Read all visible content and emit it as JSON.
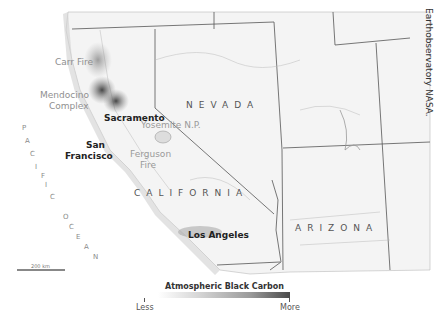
{
  "credit": "Earthobservatory NASA.",
  "labels": {
    "carr_fire": "Carr Fire",
    "mendocino_1": "Mendocino",
    "mendocino_2": "Complex",
    "sacramento": "Sacramento",
    "yosemite": "Yosemite N.P.",
    "san": "San",
    "francisco": "Francisco",
    "ferguson_1": "Ferguson",
    "ferguson_2": "Fire",
    "nevada": "NEVADA",
    "california": "CALIFORNIA",
    "arizona": "ARIZONA",
    "los_angeles": "Los Angeles",
    "pacific": [
      "P",
      "A",
      "C",
      "I",
      "F",
      "I",
      "C"
    ],
    "ocean": [
      "O",
      "C",
      "E",
      "A",
      "N"
    ]
  },
  "scale": {
    "label": "200 km"
  },
  "legend": {
    "title": "Atmospheric Black Carbon",
    "min_label": "Less",
    "max_label": "More",
    "colors": [
      "#ffffff",
      "#4a4a4a"
    ]
  }
}
